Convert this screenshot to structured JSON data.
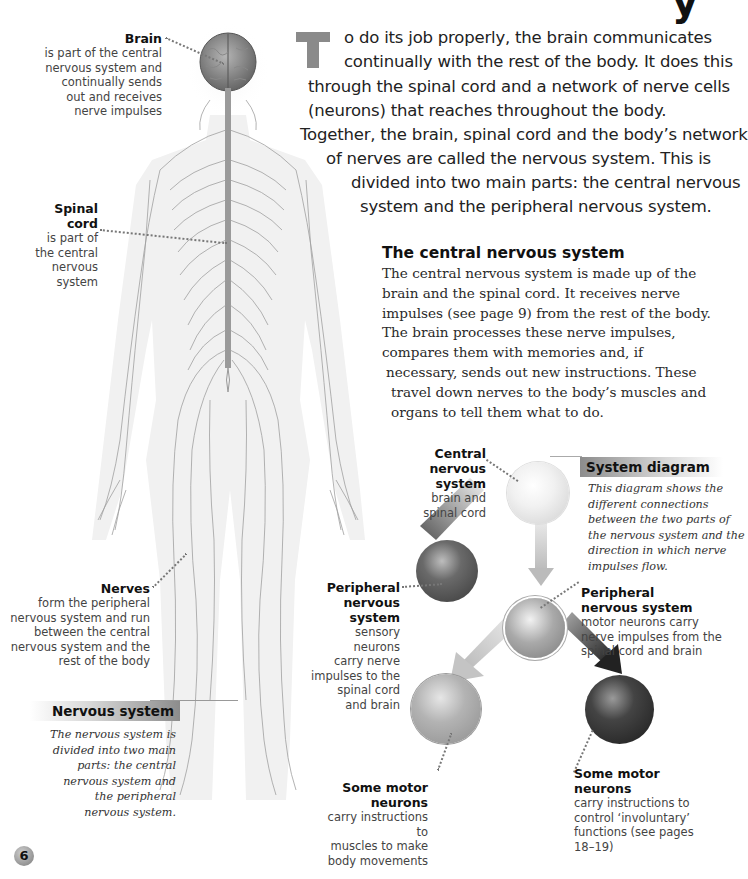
{
  "page": {
    "number": "6",
    "heading_fragment": "y"
  },
  "intro": {
    "drop_cap": "T",
    "lines": [
      "o do its job properly, the brain communicates",
      "continually with the rest of the body. It does this",
      "through the spinal cord and a network of nerve cells",
      "(neurons) that reaches throughout the body.",
      "Together, the brain, spinal cord and the body’s network",
      "of nerves are called the nervous system. This is",
      "divided into two main parts: the central nervous",
      "system and the peripheral nervous system."
    ]
  },
  "central_section": {
    "heading": "The central nervous system",
    "lines": [
      "The central nervous system is made up of the",
      "brain and the spinal cord. It receives nerve",
      "impulses (see page 9) from the rest of the body.",
      "The brain processes these nerve impulses,",
      "compares them with memories and, if",
      "necessary, sends out new instructions. These",
      "travel down nerves to the body’s muscles and",
      "organs to tell them what to do."
    ]
  },
  "body_labels": {
    "brain": {
      "title": "Brain",
      "lines": [
        "is part of the central",
        "nervous system and",
        "continually sends",
        "out and receives",
        "nerve impulses"
      ]
    },
    "spinal_cord": {
      "title_lines": [
        "Spinal",
        "cord"
      ],
      "lines": [
        "is part of",
        "the central",
        "nervous",
        "system"
      ]
    },
    "nerves": {
      "title": "Nerves",
      "lines": [
        "form the peripheral",
        "nervous system and run",
        "between the central",
        "nervous system and the",
        "rest of the body"
      ]
    }
  },
  "nervous_system_box": {
    "heading": "Nervous system",
    "lines": [
      "The nervous system is",
      "divided into two main",
      "parts: the central",
      "nervous system and",
      "the peripheral",
      "nervous system."
    ]
  },
  "system_diagram_box": {
    "heading": "System diagram",
    "lines": [
      "This diagram shows the",
      "different connections",
      "between the two parts of",
      "the nervous system and the",
      "direction in which nerve",
      "impulses flow."
    ]
  },
  "diagram_labels": {
    "central": {
      "title_lines": [
        "Central",
        "nervous",
        "system"
      ],
      "lines": [
        "brain and",
        "spinal cord"
      ]
    },
    "peripheral_sensory": {
      "title_lines": [
        "Peripheral",
        "nervous",
        "system"
      ],
      "lines": [
        "sensory neurons",
        "carry nerve",
        "impulses to the",
        "spinal cord",
        "and brain"
      ]
    },
    "peripheral_motor": {
      "title_lines": [
        "Peripheral",
        "nervous system"
      ],
      "lines": [
        "motor neurons carry",
        "nerve impulses from the",
        "spinal cord and brain"
      ]
    },
    "motor_voluntary": {
      "title_lines": [
        "Some motor",
        "neurons"
      ],
      "lines": [
        "carry instructions to",
        "muscles to make",
        "body movements"
      ]
    },
    "motor_involuntary": {
      "title_lines": [
        "Some motor",
        "neurons"
      ],
      "lines": [
        "carry instructions to",
        "control ‘involuntary’",
        "functions (see pages",
        "18–19)"
      ]
    }
  },
  "colors": {
    "drop_cap": "#8a8a8a",
    "sphere_light": "#e8e8e8",
    "sphere_mid": "#9a9a9a",
    "sphere_dark": "#3a3a3a",
    "nerve_line": "#9a9a9a"
  }
}
